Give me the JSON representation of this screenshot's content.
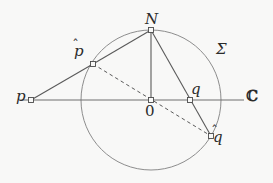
{
  "figure": {
    "width": 273,
    "height": 183,
    "background_color": "#f8f8f7",
    "stroke_color": "#5a5a5a",
    "circle_color": "#8d8d8d",
    "axis_color": "#6e6e6e",
    "label_color": "#2b2b2b"
  },
  "labels": {
    "p": "p",
    "p_hat_base": "p",
    "p_hat_mark": "̂",
    "N": "N",
    "O": "0",
    "q": "q",
    "q_hat_base": "q",
    "q_hat_mark": "̂",
    "sigma": "Σ",
    "complex_plane": "ℂ"
  },
  "chart_data": {
    "type": "scatter",
    "xlabel": "",
    "ylabel": "",
    "xlim": [
      0,
      273
    ],
    "ylim": [
      183,
      0
    ],
    "grid": false,
    "legend": null,
    "circle": {
      "name": "Σ",
      "center_x": 151,
      "center_y": 100,
      "radius": 70,
      "stroke": "#8d8d8d"
    },
    "points": [
      {
        "name": "p",
        "label": "p",
        "x": 31,
        "y": 100,
        "marker": "open-square"
      },
      {
        "name": "p_hat",
        "label": "p̂",
        "x": 93,
        "y": 64,
        "marker": "open-square"
      },
      {
        "name": "N",
        "label": "N",
        "x": 151,
        "y": 30,
        "marker": "open-square"
      },
      {
        "name": "O",
        "label": "0",
        "x": 151,
        "y": 100,
        "marker": "open-square"
      },
      {
        "name": "q",
        "label": "q",
        "x": 190,
        "y": 100,
        "marker": "open-square"
      },
      {
        "name": "q_hat",
        "label": "q̂",
        "x": 211,
        "y": 136,
        "marker": "open-square"
      }
    ],
    "segments": [
      {
        "name": "axis-real-line",
        "from": [
          20,
          100
        ],
        "to": [
          244,
          100
        ],
        "style": "solid",
        "color": "#6e6e6e"
      },
      {
        "name": "p-to-phat",
        "from": [
          31,
          100
        ],
        "to": [
          93,
          64
        ],
        "style": "solid",
        "color": "#5a5a5a"
      },
      {
        "name": "phat-to-N",
        "from": [
          93,
          64
        ],
        "to": [
          151,
          30
        ],
        "style": "solid",
        "color": "#5a5a5a"
      },
      {
        "name": "N-to-O",
        "from": [
          151,
          30
        ],
        "to": [
          151,
          100
        ],
        "style": "solid",
        "color": "#5a5a5a"
      },
      {
        "name": "N-to-qhat",
        "from": [
          151,
          30
        ],
        "to": [
          211,
          136
        ],
        "style": "solid",
        "color": "#5a5a5a"
      },
      {
        "name": "phat-to-qhat-diameter",
        "from": [
          93,
          64
        ],
        "to": [
          211,
          136
        ],
        "style": "dashed",
        "color": "#5a5a5a"
      }
    ]
  }
}
